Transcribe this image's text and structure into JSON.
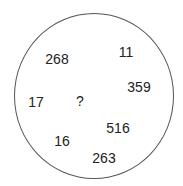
{
  "puzzle": {
    "shape": "circle",
    "numbers": [
      {
        "value": "268",
        "x": 57,
        "y": 59
      },
      {
        "value": "11",
        "x": 126,
        "y": 52
      },
      {
        "value": "359",
        "x": 139,
        "y": 87
      },
      {
        "value": "17",
        "x": 36,
        "y": 102
      },
      {
        "value": "?",
        "x": 80,
        "y": 101
      },
      {
        "value": "516",
        "x": 118,
        "y": 128
      },
      {
        "value": "16",
        "x": 62,
        "y": 141
      },
      {
        "value": "263",
        "x": 104,
        "y": 158
      }
    ],
    "colors": {
      "outline": "#555555",
      "text": "#222222",
      "background": "#ffffff"
    }
  }
}
